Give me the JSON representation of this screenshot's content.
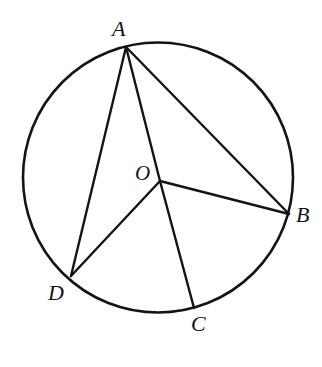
{
  "figure": {
    "kind": "geometry-diagram",
    "width": 322,
    "height": 367,
    "background_color": "#ffffff",
    "stroke_color": "#141414",
    "label_color": "#141414",
    "stroke_width": 2.4
  },
  "circle": {
    "name": "main-circle",
    "center_x": 158,
    "center_y": 177.5,
    "radius": 135,
    "stroke_color": "#141414",
    "stroke_width": 2.6,
    "fill": "none"
  },
  "points": [
    {
      "id": "A",
      "label": "A",
      "x": 126,
      "y": 47,
      "on_circle": true,
      "label_x": 112,
      "label_y": 18
    },
    {
      "id": "B",
      "label": "B",
      "x": 289,
      "y": 214,
      "on_circle": true,
      "label_x": 296,
      "label_y": 204
    },
    {
      "id": "C",
      "label": "C",
      "x": 194,
      "y": 308,
      "on_circle": true,
      "label_x": 191,
      "label_y": 313
    },
    {
      "id": "D",
      "label": "D",
      "x": 71,
      "y": 276,
      "on_circle": true,
      "label_x": 48,
      "label_y": 282
    },
    {
      "id": "O",
      "label": "O",
      "x": 160,
      "y": 181,
      "on_circle": false,
      "label_x": 135,
      "label_y": 163
    }
  ],
  "segments": [
    {
      "id": "AD",
      "from": "A",
      "to": "D",
      "x1": 126,
      "y1": 47,
      "x2": 71,
      "y2": 276
    },
    {
      "id": "AB",
      "from": "A",
      "to": "B",
      "x1": 126,
      "y1": 47,
      "x2": 289,
      "y2": 214
    },
    {
      "id": "AO",
      "from": "A",
      "to": "O",
      "x1": 126,
      "y1": 47,
      "x2": 160,
      "y2": 181
    },
    {
      "id": "OC",
      "from": "O",
      "to": "C",
      "x1": 160,
      "y1": 181,
      "x2": 194,
      "y2": 308
    },
    {
      "id": "OB",
      "from": "O",
      "to": "B",
      "x1": 160,
      "y1": 181,
      "x2": 289,
      "y2": 214
    },
    {
      "id": "OD",
      "from": "O",
      "to": "D",
      "x1": 160,
      "y1": 181,
      "x2": 71,
      "y2": 276
    }
  ],
  "labels": {
    "A": "A",
    "B": "B",
    "C": "C",
    "D": "D",
    "O": "O"
  }
}
